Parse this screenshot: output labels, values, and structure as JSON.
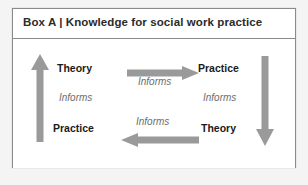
{
  "figure": {
    "box_label": "Box A",
    "separator": "|",
    "title": "Box A | Knowledge for social work practice",
    "border_color": "#8a8a8a",
    "background_color": "#ffffff",
    "page_background": "#f4f4f4"
  },
  "diagram": {
    "type": "cycle",
    "arrow_color": "#9a9a9a",
    "text_color": "#1a1a1a",
    "italic_text_color": "#6d6d6d",
    "left_column": {
      "top_label": "Theory",
      "middle_label": "Informs",
      "bottom_label": "Practice"
    },
    "right_column": {
      "top_label": "Practice",
      "middle_label": "Informs",
      "bottom_label": "Theory"
    },
    "center": {
      "top_label": "Informs",
      "bottom_label": "Informs"
    },
    "arrows": [
      {
        "name": "arrow-up-left",
        "direction": "up"
      },
      {
        "name": "arrow-right-top",
        "direction": "right"
      },
      {
        "name": "arrow-down-right",
        "direction": "down"
      },
      {
        "name": "arrow-left-bottom",
        "direction": "left"
      }
    ]
  }
}
